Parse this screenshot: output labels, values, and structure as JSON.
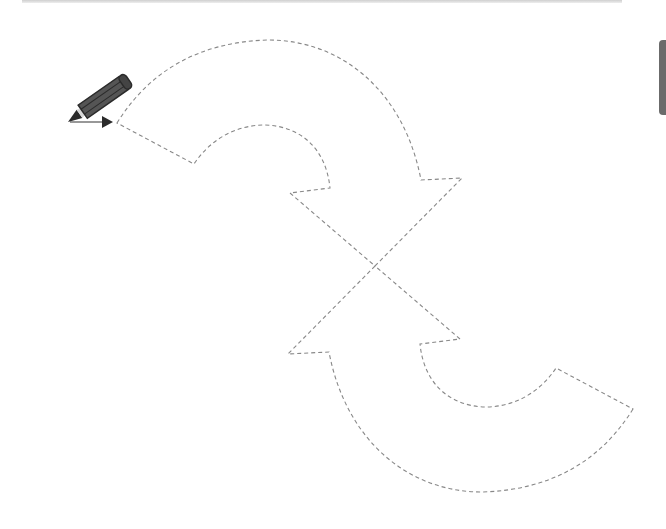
{
  "worksheet": {
    "type": "tracing-worksheet",
    "subject": "dashed outline of two curved arrows forming a cycle",
    "start_marker": {
      "icon": "pencil-icon",
      "pointer": "arrow-right-icon"
    },
    "colors": {
      "dash_stroke": "#888888",
      "pencil_body": "#555555",
      "background": "#ffffff",
      "side_tab": "#6b6b6b"
    }
  }
}
